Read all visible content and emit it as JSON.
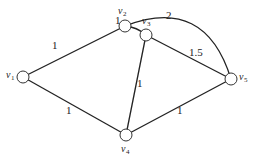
{
  "graph": {
    "nodes": [
      {
        "id": "v1",
        "label": "v",
        "sub": "1"
      },
      {
        "id": "v2",
        "label": "v",
        "sub": "2"
      },
      {
        "id": "v3",
        "label": "v",
        "sub": "3"
      },
      {
        "id": "v4",
        "label": "v",
        "sub": "4"
      },
      {
        "id": "v5",
        "label": "v",
        "sub": "5"
      }
    ],
    "edges": [
      {
        "from": "v1",
        "to": "v2",
        "weight": "1"
      },
      {
        "from": "v2",
        "to": "v3",
        "weight": "1"
      },
      {
        "from": "v2",
        "to": "v5",
        "weight": "2"
      },
      {
        "from": "v3",
        "to": "v5",
        "weight": "1.5"
      },
      {
        "from": "v3",
        "to": "v4",
        "weight": "1"
      },
      {
        "from": "v1",
        "to": "v4",
        "weight": "1"
      },
      {
        "from": "v4",
        "to": "v5",
        "weight": "1"
      }
    ]
  }
}
